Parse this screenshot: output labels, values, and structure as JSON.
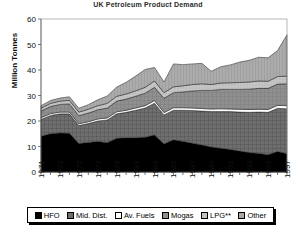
{
  "chart": {
    "title": "UK Petroleum Product Demand",
    "ylabel": "Million Tonnes"
  },
  "legend": {
    "items": [
      {
        "label": "HFO",
        "key": "hfo",
        "color": "#000000",
        "pattern": "solid"
      },
      {
        "label": "Mid. Dist.",
        "key": "middist",
        "color": "#6e6e6e",
        "pattern": "grid"
      },
      {
        "label": "Av. Fuels",
        "key": "avfuels",
        "color": "#ffffff",
        "pattern": "solid"
      },
      {
        "label": "Mogas",
        "key": "mogas",
        "color": "#8f8f8f",
        "pattern": "hatch"
      },
      {
        "label": "LPG**",
        "key": "lpg",
        "color": "#c2c2c2",
        "pattern": "dots"
      },
      {
        "label": "Other",
        "key": "other",
        "color": "#a8a8a8",
        "pattern": "vert"
      }
    ]
  },
  "chart_data": {
    "type": "area",
    "stacked": true,
    "title": "UK Petroleum Product Demand",
    "xlabel": "",
    "ylabel": "Million Tonnes",
    "ylim": [
      0,
      60
    ],
    "yticks": [
      0,
      10,
      20,
      30,
      40,
      50,
      60
    ],
    "grid": false,
    "legend_position": "bottom",
    "x": [
      1971,
      1972,
      1973,
      1974,
      1975,
      1976,
      1977,
      1978,
      1979,
      1980,
      1981,
      1982,
      1983,
      1984,
      1985,
      1986,
      1987,
      1988,
      1989,
      1990,
      1991,
      1992,
      1993,
      1994,
      1995,
      1996,
      1997
    ],
    "xtick_labels": [
      "1971",
      "1973",
      "1975",
      "1977",
      "1979",
      "1981",
      "1983",
      "1985",
      "1987",
      "1989",
      "1991",
      "1993",
      "1995",
      "1997"
    ],
    "series": [
      {
        "name": "HFO",
        "values": [
          14.0,
          15.0,
          15.3,
          15.2,
          11.2,
          11.6,
          12.0,
          11.5,
          13.2,
          13.4,
          13.4,
          13.6,
          14.5,
          11.0,
          12.6,
          12.0,
          11.3,
          10.6,
          9.8,
          9.3,
          8.8,
          8.2,
          7.6,
          7.3,
          6.8,
          8.0,
          7.2
        ]
      },
      {
        "name": "Mid. Dist.",
        "values": [
          6.6,
          7.2,
          7.5,
          7.6,
          7.0,
          7.4,
          8.0,
          8.9,
          9.6,
          10.0,
          10.8,
          11.5,
          12.5,
          11.4,
          11.6,
          12.2,
          12.8,
          13.3,
          13.9,
          14.4,
          14.9,
          15.3,
          15.8,
          16.2,
          16.6,
          17.0,
          17.6
        ]
      },
      {
        "name": "Av. Fuels",
        "values": [
          0.7,
          0.7,
          0.7,
          0.7,
          0.7,
          0.7,
          0.8,
          0.8,
          0.8,
          0.8,
          0.9,
          0.9,
          1.0,
          0.9,
          1.0,
          1.0,
          1.0,
          1.0,
          1.0,
          1.1,
          1.0,
          1.1,
          1.1,
          1.1,
          1.1,
          1.1,
          1.2
        ]
      },
      {
        "name": "Mogas",
        "values": [
          2.6,
          2.8,
          3.0,
          3.2,
          3.2,
          3.4,
          3.6,
          3.9,
          4.2,
          4.4,
          4.6,
          4.9,
          5.2,
          5.6,
          5.9,
          6.2,
          6.7,
          7.1,
          7.3,
          7.6,
          7.7,
          7.8,
          8.0,
          8.2,
          8.3,
          8.4,
          8.6
        ]
      },
      {
        "name": "LPG**",
        "values": [
          1.1,
          1.2,
          1.3,
          1.4,
          1.4,
          1.5,
          1.6,
          1.8,
          1.9,
          2.0,
          2.1,
          2.3,
          2.5,
          2.2,
          2.3,
          2.4,
          2.5,
          2.6,
          2.3,
          2.5,
          2.6,
          2.7,
          2.8,
          2.9,
          2.8,
          2.9,
          3.0
        ]
      },
      {
        "name": "Other",
        "values": [
          1.0,
          1.1,
          1.2,
          1.4,
          1.5,
          1.8,
          2.3,
          2.9,
          3.6,
          4.6,
          5.8,
          7.0,
          5.3,
          4.2,
          9.0,
          8.3,
          8.1,
          8.0,
          5.2,
          6.4,
          7.0,
          8.0,
          8.5,
          9.3,
          9.2,
          10.2,
          16.2
        ]
      }
    ]
  }
}
